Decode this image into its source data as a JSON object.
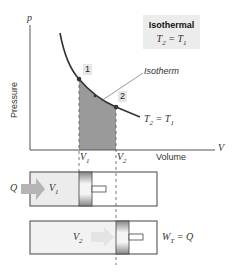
{
  "title_box": {
    "title": "Isothermal",
    "equation": "T2 = T1",
    "eq_lhs": "T",
    "eq_lhs_sub": "2",
    "eq_rhs": "T",
    "eq_rhs_sub": "1"
  },
  "axes": {
    "y_symbol": "p",
    "y_label": "Pressure",
    "x_symbol": "V",
    "x_label": "Volume"
  },
  "curve": {
    "label": "Isotherm",
    "end_label_lhs": "T",
    "end_label_lhs_sub": "2",
    "end_label_rhs": "T",
    "end_label_rhs_sub": "1"
  },
  "points": [
    {
      "label": "1"
    },
    {
      "label": "2"
    }
  ],
  "volumes": [
    {
      "sym": "V",
      "sub": "1"
    },
    {
      "sym": "V",
      "sub": "2"
    }
  ],
  "cylinder_1": {
    "heat_label": "Q",
    "vol_sym": "V",
    "vol_sub": "1"
  },
  "cylinder_2": {
    "vol_sym": "V",
    "vol_sub": "2",
    "work_sym": "W",
    "work_sub": "T",
    "work_rhs": "Q"
  },
  "colors": {
    "shade": "#9a9a9a",
    "gas": "#ececec",
    "arrow": "#b5b5b5",
    "line": "#333333"
  }
}
